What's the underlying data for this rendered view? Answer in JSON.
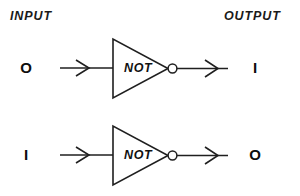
{
  "diagram": {
    "title_left": "INPUT",
    "title_right": "OUTPUT",
    "line_color": "#1f1f1f",
    "text_color": "#111111",
    "background": "#ffffff",
    "rows": [
      {
        "input_value": "O",
        "gate_label": "NOT",
        "output_value": "I"
      },
      {
        "input_value": "I",
        "gate_label": "NOT",
        "output_value": "O"
      }
    ]
  }
}
